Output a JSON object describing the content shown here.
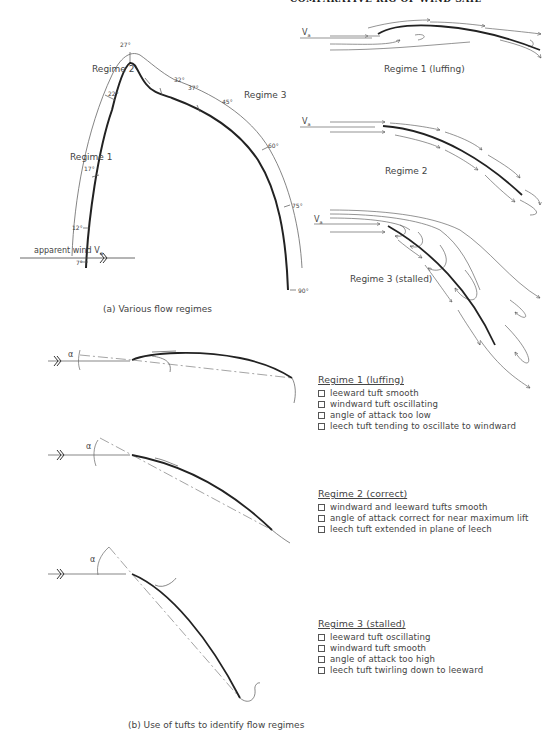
{
  "header": {
    "running_title": "COMPARATIVE RIG OF WIND SAIL"
  },
  "part_a": {
    "caption": "(a)  Various flow regimes",
    "regime_curve": {
      "labels": {
        "regime1": "Regime 1",
        "regime2": "Regime 2",
        "regime3": "Regime 3"
      },
      "angles": [
        "7°",
        "12°",
        "17°",
        "22°",
        "27°",
        "32°",
        "37°",
        "45°",
        "60°",
        "75°",
        "90°"
      ],
      "wind_label": "apparent wind  V",
      "wind_subscript": "a"
    },
    "flow_diagrams": [
      {
        "id": "regime1",
        "label": "Regime 1  (luffing)",
        "wind_label": "V",
        "wind_subscript": "a"
      },
      {
        "id": "regime2",
        "label": "Regime 2",
        "wind_label": "V",
        "wind_subscript": "a"
      },
      {
        "id": "regime3",
        "label": "Regime 3  (stalled)",
        "wind_label": "V",
        "wind_subscript": "a"
      }
    ]
  },
  "part_b": {
    "caption": "(b)  Use of tufts to identify flow regimes",
    "alpha_symbol": "α",
    "panels": [
      {
        "title": "Regime 1  (luffing)",
        "items": [
          "leeward tuft smooth",
          "windward tuft oscillating",
          "angle of attack too low",
          "leech tuft tending to oscillate to windward"
        ]
      },
      {
        "title": "Regime 2  (correct)",
        "items": [
          "windward and leeward tufts smooth",
          "angle of attack correct for near maximum lift",
          "leech tuft extended in plane of leech"
        ]
      },
      {
        "title": "Regime 3  (stalled)",
        "items": [
          "leeward tuft oscillating",
          "windward tuft smooth",
          "angle of attack too high",
          "leech tuft twirling down to leeward"
        ]
      }
    ]
  },
  "colors": {
    "ink": "#222222",
    "thin_ink": "#555555",
    "background": "#ffffff"
  }
}
